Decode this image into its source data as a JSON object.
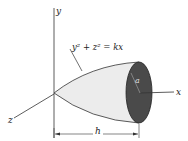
{
  "diagram": {
    "labels": {
      "y_axis": "y",
      "x_axis": "x",
      "z_axis": "z",
      "radius": "a",
      "length": "h"
    },
    "equation": "y² + z² = kx",
    "colors": {
      "surface": "#ececec",
      "end_face": "#4a4a4a",
      "lines": "#333333"
    }
  }
}
